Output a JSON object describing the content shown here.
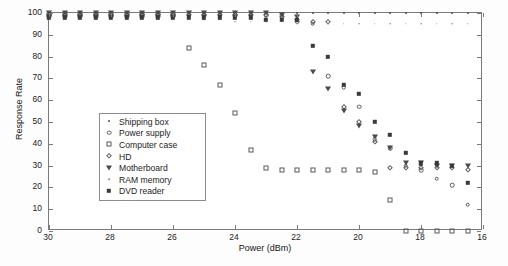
{
  "chart_data": {
    "type": "scatter",
    "title": "",
    "xlabel": "Power (dBm)",
    "ylabel": "Response Rate",
    "xlim": [
      30,
      16
    ],
    "ylim": [
      0,
      100
    ],
    "xticks": [
      30,
      28,
      26,
      24,
      22,
      20,
      18,
      16
    ],
    "yticks": [
      0,
      10,
      20,
      30,
      40,
      50,
      60,
      70,
      80,
      90,
      100
    ],
    "xtick_labels": [
      "30",
      "28",
      "26",
      "24",
      "22",
      "20",
      "18",
      "16"
    ],
    "ytick_labels": [
      "0",
      "10",
      "20",
      "30",
      "40",
      "50",
      "60",
      "70",
      "80",
      "90",
      "100"
    ],
    "grid": false,
    "axis_reversed_x": true,
    "legend_position": "center-left",
    "series": [
      {
        "name": "Shipping box",
        "marker": "dot",
        "x": [
          30,
          29.5,
          29,
          28.5,
          28,
          27.5,
          27,
          26.5,
          26,
          25.5,
          25,
          24.5,
          24,
          23.5,
          23,
          22.5,
          22,
          21.5,
          21,
          20.5,
          20,
          19.5,
          19,
          18.5,
          18,
          17.5,
          17,
          16.5
        ],
        "y": [
          100,
          100,
          100,
          100,
          100,
          100,
          100,
          100,
          100,
          100,
          100,
          100,
          100,
          100,
          100,
          100,
          100,
          100,
          100,
          100,
          100,
          100,
          100,
          100,
          100,
          100,
          100,
          100
        ]
      },
      {
        "name": "Power supply",
        "marker": "circle",
        "x": [
          30,
          29.5,
          29,
          28.5,
          28,
          27.5,
          27,
          26.5,
          26,
          25.5,
          25,
          24.5,
          24,
          23.5,
          23,
          22.5,
          22,
          21.5,
          21,
          20.5,
          20,
          19.5,
          19,
          18.5,
          18,
          17.5,
          17,
          16.5
        ],
        "y": [
          99,
          99,
          99,
          99,
          99,
          99,
          99,
          99,
          99,
          99,
          99,
          99,
          99,
          99,
          99,
          99,
          96,
          95,
          71,
          66,
          57,
          42,
          38,
          30,
          28,
          24,
          21,
          12
        ]
      },
      {
        "name": "Computer case",
        "marker": "square",
        "x": [
          30,
          29.5,
          29,
          28.5,
          28,
          27.5,
          27,
          26.5,
          26,
          25.5,
          25,
          24.5,
          24,
          23.5,
          23,
          22.5,
          22,
          21.5,
          21,
          20.5,
          20,
          19.5,
          19,
          18.5,
          18,
          17.5,
          17,
          16.5
        ],
        "y": [
          99,
          99,
          99,
          99,
          99,
          99,
          99,
          99,
          99,
          84,
          76,
          67,
          54,
          37,
          29,
          28,
          28,
          28,
          28,
          28,
          28,
          27,
          14,
          0,
          0,
          0,
          0,
          0
        ]
      },
      {
        "name": "HD",
        "marker": "diamond",
        "x": [
          30,
          29.5,
          29,
          28.5,
          28,
          27.5,
          27,
          26.5,
          26,
          25.5,
          25,
          24.5,
          24,
          23.5,
          23,
          22.5,
          22,
          21.5,
          21,
          20.5,
          20,
          19.5,
          19,
          18.5,
          18,
          17.5,
          17,
          16.5
        ],
        "y": [
          99,
          99,
          99,
          99,
          99,
          99,
          99,
          99,
          99,
          99,
          99,
          99,
          99,
          99,
          99,
          98,
          97,
          96,
          96,
          57,
          50,
          41,
          29,
          29,
          29,
          29,
          29,
          28
        ]
      },
      {
        "name": "Motherboard",
        "marker": "triangle-down",
        "x": [
          30,
          29.5,
          29,
          28.5,
          28,
          27.5,
          27,
          26.5,
          26,
          25.5,
          25,
          24.5,
          24,
          23.5,
          23,
          22.5,
          22,
          21.5,
          21,
          20.5,
          20,
          19.5,
          19,
          18.5,
          18,
          17.5,
          17,
          16.5
        ],
        "y": [
          100,
          100,
          100,
          100,
          100,
          100,
          100,
          100,
          100,
          100,
          100,
          100,
          100,
          100,
          100,
          99,
          98,
          73,
          65,
          55,
          48,
          43,
          38,
          31,
          31,
          30,
          30,
          30
        ]
      },
      {
        "name": "RAM memory",
        "marker": "tiny-dot",
        "x": [
          30,
          29.5,
          29,
          28.5,
          28,
          27.5,
          27,
          26.5,
          26,
          25.5,
          25,
          24.5,
          24,
          23.5,
          23,
          22.5,
          22,
          21.5,
          21,
          20.5,
          20,
          19.5,
          19,
          18.5,
          18,
          17.5,
          17,
          16.5
        ],
        "y": [
          98,
          98,
          98,
          98,
          98,
          98,
          98,
          98,
          98,
          98,
          97,
          97,
          96,
          96,
          96,
          96,
          95,
          95,
          95,
          95,
          95,
          95,
          95,
          95,
          95,
          95,
          95,
          95
        ]
      },
      {
        "name": "DVD reader",
        "marker": "filled-square",
        "x": [
          30,
          29.5,
          29,
          28.5,
          28,
          27.5,
          27,
          26.5,
          26,
          25.5,
          25,
          24.5,
          24,
          23.5,
          23,
          22.5,
          22,
          21.5,
          21,
          20.5,
          20,
          19.5,
          19,
          18.5,
          18,
          17.5,
          17,
          16.5
        ],
        "y": [
          98,
          98,
          98,
          98,
          98,
          98,
          98,
          98,
          98,
          98,
          98,
          98,
          98,
          98,
          97,
          97,
          97,
          85,
          80,
          67,
          63,
          50,
          44,
          36,
          31,
          31,
          30,
          22
        ]
      }
    ]
  },
  "legend": {
    "items": [
      {
        "label": "Shipping box",
        "marker": "dot"
      },
      {
        "label": "Power supply",
        "marker": "circle"
      },
      {
        "label": "Computer case",
        "marker": "square"
      },
      {
        "label": "HD",
        "marker": "diamond"
      },
      {
        "label": "Motherboard",
        "marker": "triangle-down"
      },
      {
        "label": "RAM memory",
        "marker": "tiny-dot"
      },
      {
        "label": "DVD reader",
        "marker": "filled-square"
      }
    ]
  },
  "colors": {
    "marker": "#4a4a4a",
    "axis": "#7a7a7a",
    "text": "#1c1c1c",
    "background": "#ffffff"
  }
}
